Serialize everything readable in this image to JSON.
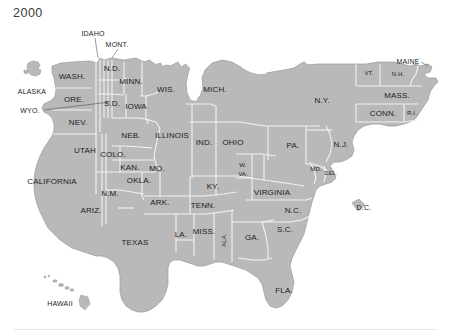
{
  "figure": {
    "title": "2000",
    "type": "cartogram",
    "colors": {
      "land_fill": "#b9b9b9",
      "land_stroke": "#f2f2f2",
      "outer_stroke": "#8f8f8f",
      "background": "#ffffff",
      "label_text": "#1c1c1c",
      "title_text": "#3b3b3b",
      "rule": "#e6e6e6"
    }
  },
  "labels": {
    "inside": [
      {
        "name": "washington",
        "text": "WASH.",
        "x": 72,
        "y": 76,
        "size": "big"
      },
      {
        "name": "oregon",
        "text": "ORE.",
        "x": 74,
        "y": 99,
        "size": "big"
      },
      {
        "name": "nevada",
        "text": "NEV.",
        "x": 78,
        "y": 122,
        "size": "big"
      },
      {
        "name": "california",
        "text": "CALIFORNIA",
        "x": 52,
        "y": 181,
        "size": "big"
      },
      {
        "name": "utah",
        "text": "UTAH",
        "x": 85,
        "y": 150,
        "size": "big"
      },
      {
        "name": "arizona",
        "text": "ARIZ.",
        "x": 91,
        "y": 210,
        "size": "big"
      },
      {
        "name": "new-mexico",
        "text": "N.M.",
        "x": 110,
        "y": 193,
        "size": "big"
      },
      {
        "name": "colorado",
        "text": "COLO.",
        "x": 113,
        "y": 154,
        "size": "big"
      },
      {
        "name": "north-dakota",
        "text": "N.D.",
        "x": 112,
        "y": 68,
        "size": "big"
      },
      {
        "name": "south-dakota",
        "text": "S.D.",
        "x": 112,
        "y": 103,
        "size": "big"
      },
      {
        "name": "minnesota",
        "text": "MINN.",
        "x": 131,
        "y": 81,
        "size": "big"
      },
      {
        "name": "iowa",
        "text": "IOWA",
        "x": 136,
        "y": 106,
        "size": "big"
      },
      {
        "name": "nebraska",
        "text": "NEB.",
        "x": 131,
        "y": 135,
        "size": "big"
      },
      {
        "name": "kansas",
        "text": "KAN.",
        "x": 130,
        "y": 167,
        "size": "big"
      },
      {
        "name": "oklahoma",
        "text": "OKLA.",
        "x": 139,
        "y": 180,
        "size": "big"
      },
      {
        "name": "texas",
        "text": "TEXAS",
        "x": 135,
        "y": 242,
        "size": "big"
      },
      {
        "name": "missouri",
        "text": "MO.",
        "x": 157,
        "y": 168,
        "size": "big"
      },
      {
        "name": "arkansas",
        "text": "ARK.",
        "x": 160,
        "y": 202,
        "size": "big"
      },
      {
        "name": "louisiana",
        "text": "LA.",
        "x": 181,
        "y": 234,
        "size": "big"
      },
      {
        "name": "mississippi",
        "text": "MISS.",
        "x": 204,
        "y": 231,
        "size": "big"
      },
      {
        "name": "alabama",
        "text": "ALA.",
        "x": 224,
        "y": 240,
        "size": "small",
        "rotate": true
      },
      {
        "name": "tennessee",
        "text": "TENN.",
        "x": 203,
        "y": 205,
        "size": "big"
      },
      {
        "name": "kentucky",
        "text": "KY.",
        "x": 213,
        "y": 186,
        "size": "big"
      },
      {
        "name": "illinois",
        "text": "ILLINOIS",
        "x": 172,
        "y": 135,
        "size": "big"
      },
      {
        "name": "wisconsin",
        "text": "WIS.",
        "x": 166,
        "y": 89,
        "size": "big"
      },
      {
        "name": "michigan",
        "text": "MICH.",
        "x": 215,
        "y": 89,
        "size": "big"
      },
      {
        "name": "indiana",
        "text": "IND.",
        "x": 204,
        "y": 142,
        "size": "big"
      },
      {
        "name": "ohio",
        "text": "OHIO",
        "x": 233,
        "y": 142,
        "size": "big"
      },
      {
        "name": "west-virginia-1",
        "text": "W.",
        "x": 243,
        "y": 165,
        "size": "small"
      },
      {
        "name": "west-virginia-2",
        "text": "VA.",
        "x": 243,
        "y": 174,
        "size": "small"
      },
      {
        "name": "virginia",
        "text": "VIRGINIA",
        "x": 272,
        "y": 192,
        "size": "big"
      },
      {
        "name": "north-carolina",
        "text": "N.C.",
        "x": 293,
        "y": 210,
        "size": "big"
      },
      {
        "name": "south-carolina",
        "text": "S.C.",
        "x": 285,
        "y": 229,
        "size": "big"
      },
      {
        "name": "georgia",
        "text": "GA.",
        "x": 252,
        "y": 237,
        "size": "big"
      },
      {
        "name": "florida",
        "text": "FLA.",
        "x": 284,
        "y": 290,
        "size": "big"
      },
      {
        "name": "pennsylvania",
        "text": "PA.",
        "x": 293,
        "y": 145,
        "size": "big"
      },
      {
        "name": "new-york",
        "text": "N.Y.",
        "x": 322,
        "y": 100,
        "size": "big"
      },
      {
        "name": "new-jersey",
        "text": "N.J.",
        "x": 341,
        "y": 144,
        "size": "big"
      },
      {
        "name": "maryland",
        "text": "MD.",
        "x": 316,
        "y": 169,
        "size": "small"
      },
      {
        "name": "delaware",
        "text": "DEL.",
        "x": 331,
        "y": 173,
        "size": "tiny"
      },
      {
        "name": "vermont",
        "text": "VT.",
        "x": 369,
        "y": 73,
        "size": "small"
      },
      {
        "name": "new-hampshire",
        "text": "N.H.",
        "x": 398,
        "y": 74,
        "size": "small"
      },
      {
        "name": "massachusetts",
        "text": "MASS.",
        "x": 397,
        "y": 95,
        "size": "big"
      },
      {
        "name": "connecticut",
        "text": "CONN.",
        "x": 383,
        "y": 113,
        "size": "big"
      },
      {
        "name": "rhode-island",
        "text": "R.I.",
        "x": 412,
        "y": 113,
        "size": "small"
      }
    ],
    "outside": [
      {
        "name": "idaho",
        "text": "IDAHO",
        "x": 93,
        "y": 33
      },
      {
        "name": "montana",
        "text": "MONT.",
        "x": 117,
        "y": 44
      },
      {
        "name": "maine",
        "text": "MAINE",
        "x": 408,
        "y": 61
      },
      {
        "name": "alaska",
        "text": "ALASKA",
        "x": 32,
        "y": 91
      },
      {
        "name": "wyoming",
        "text": "WYO.",
        "x": 30,
        "y": 110
      },
      {
        "name": "hawaii",
        "text": "HAWAII",
        "x": 60,
        "y": 303
      },
      {
        "name": "district-of-columbia",
        "text": "D.C.",
        "x": 364,
        "y": 207
      }
    ]
  }
}
